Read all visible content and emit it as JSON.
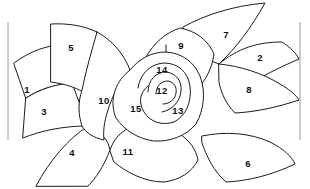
{
  "figure": {
    "type": "line-art-numbered-regions",
    "background_color": "#ffffff",
    "stroke_color": "#1c1c1c",
    "label_color": "#111111",
    "frame_color": "#9a9a9a"
  },
  "frame": {
    "left_rule_x": 8,
    "right_rule_x": 300,
    "rule_top_y": 22,
    "rule_bottom_y": 140
  },
  "regions": [
    {
      "id": 1,
      "label": "1",
      "x": 27,
      "y": 89,
      "name": "petal-1-left-outer-upper"
    },
    {
      "id": 2,
      "label": "2",
      "x": 260,
      "y": 57,
      "name": "petal-2-right-outer-upper"
    },
    {
      "id": 3,
      "label": "3",
      "x": 44,
      "y": 111,
      "name": "petal-3-left-outer-lower"
    },
    {
      "id": 4,
      "label": "4",
      "x": 72,
      "y": 152,
      "name": "petal-4-bottom-left"
    },
    {
      "id": 5,
      "label": "5",
      "x": 71,
      "y": 47,
      "name": "petal-5-top-left"
    },
    {
      "id": 6,
      "label": "6",
      "x": 248,
      "y": 163,
      "name": "petal-6-bottom-right"
    },
    {
      "id": 7,
      "label": "7",
      "x": 226,
      "y": 34,
      "name": "petal-7-top-right"
    },
    {
      "id": 8,
      "label": "8",
      "x": 249,
      "y": 89,
      "name": "petal-8-right-middle"
    },
    {
      "id": 9,
      "label": "9",
      "x": 181,
      "y": 45,
      "name": "petal-9-top-center"
    },
    {
      "id": 10,
      "label": "10",
      "x": 104,
      "y": 100,
      "name": "petal-10-center-left"
    },
    {
      "id": 11,
      "label": "11",
      "x": 128,
      "y": 151,
      "name": "petal-11-bottom-center"
    },
    {
      "id": 12,
      "label": "12",
      "x": 162,
      "y": 90,
      "name": "petal-12-core-inner"
    },
    {
      "id": 13,
      "label": "13",
      "x": 178,
      "y": 110,
      "name": "petal-13-core-right"
    },
    {
      "id": 14,
      "label": "14",
      "x": 162,
      "y": 69,
      "name": "petal-14-core-top"
    },
    {
      "id": 15,
      "label": "15",
      "x": 136,
      "y": 108,
      "name": "petal-15-core-left"
    }
  ],
  "shapes": {
    "petal_1": "M 14,63 C 30,51 48,45 62,45 L 70,84 C 52,85 38,90 26,98 Z",
    "petal_3": "M 26,98 C 40,89 56,84 72,83 L 88,126 C 62,126 40,131 23,138 Z",
    "petal_5": "M 51,24 C 69,23 84,26 97,32 C 100,58 98,78 90,96 C 78,88 66,84 51,82 Z",
    "petal_4": "M 36,186 C 50,160 68,139 88,126 C 101,132 108,139 110,150 C 104,166 96,178 88,186 Z",
    "petal_7": "M 183,27 C 205,15 232,6 265,3 C 251,28 236,48 219,64 C 208,60 199,55 193,48 Z",
    "petal_2": "M 219,64 C 238,48 258,42 282,42 C 291,48 296,53 299,59 C 283,66 268,73 257,80 Z",
    "petal_8": "M 219,64 C 240,66 262,73 280,84 C 290,90 296,95 299,100 C 278,107 256,112 235,113 C 226,104 221,93 219,82 Z",
    "petal_6": "M 202,136 C 226,131 250,133 270,142 C 284,149 292,157 295,164 C 272,175 248,181 226,182 C 214,172 206,155 202,143 Z",
    "petal_9": "M 146,57 C 154,43 165,33 180,28 C 196,31 208,40 214,54 C 212,68 206,80 198,88 C 186,72 168,62 146,60 Z",
    "petal_10": "M 97,32 C 112,40 124,54 130,70 C 120,82 112,96 108,110 C 104,122 103,132 104,140 C 94,138 86,133 82,126 C 78,114 78,102 82,90 C 86,70 92,50 97,32 Z",
    "petal_11": "M 110,150 C 114,138 122,130 134,126 C 150,124 166,126 178,133 C 190,140 196,150 198,160 C 192,172 180,180 164,182 C 144,182 126,172 114,162 Z",
    "outer_bowl": "M 130,70 C 140,58 152,52 166,52 C 182,53 194,62 200,76 C 206,92 204,110 196,124 C 186,136 170,142 154,141 C 138,139 124,130 116,118 C 110,104 112,84 130,70 Z",
    "coil_outer": "M 138,88 C 140,74 150,64 164,63 C 178,63 188,72 190,86 C 192,102 186,116 174,122",
    "coil_mid": "M 148,92 C 148,80 156,72 166,72 C 176,73 182,81 181,91 C 180,102 172,110 162,112",
    "coil_inner": "M 156,94 C 156,86 161,81 168,81 C 174,82 177,87 176,93 C 175,100 169,104 163,104",
    "coil_tail": "M 174,122 C 162,126 150,122 144,112 C 138,102 140,92 148,86",
    "stem_tick": "M 166,52 L 166,45"
  }
}
